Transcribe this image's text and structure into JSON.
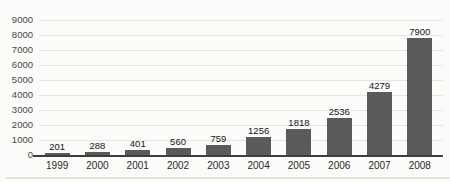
{
  "chart_data": {
    "type": "bar",
    "title": "",
    "xlabel": "",
    "ylabel": "",
    "categories": [
      "1999",
      "2000",
      "2001",
      "2002",
      "2003",
      "2004",
      "2005",
      "2006",
      "2007",
      "2008"
    ],
    "values": [
      201,
      288,
      401,
      560,
      759,
      1256,
      1818,
      2536,
      4279,
      7900
    ],
    "ylim": [
      0,
      9000
    ],
    "yticks": [
      0,
      1000,
      2000,
      3000,
      4000,
      5000,
      6000,
      7000,
      8000,
      9000
    ],
    "grid": true,
    "legend": false,
    "bar_color": "#5a5a5c",
    "axis_color": "#3e3e3e",
    "gridline_color": "#e5e5e0",
    "value_label_color": "#161616",
    "tick_label_color": "#474747",
    "background_color": "#fbfbf9"
  }
}
